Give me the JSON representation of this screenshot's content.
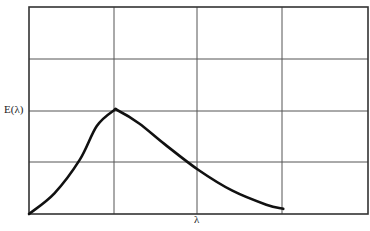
{
  "chart_data": {
    "type": "line",
    "title": "",
    "xlabel": "λ",
    "ylabel": "E(λ)",
    "grid": true,
    "legend": null,
    "xlim": [
      0,
      4
    ],
    "ylim": [
      0,
      4
    ],
    "x_ticks": [],
    "y_ticks": [],
    "series": [
      {
        "name": "E(λ)",
        "x": [
          0,
          0.3,
          0.6,
          0.8,
          1.0,
          1.05,
          1.3,
          1.6,
          2.0,
          2.4,
          2.8,
          3.0
        ],
        "y": [
          0,
          0.4,
          1.05,
          1.7,
          2.0,
          2.0,
          1.75,
          1.35,
          0.85,
          0.45,
          0.18,
          0.1
        ]
      }
    ],
    "annotations": []
  },
  "labels": {
    "y_axis": "E(λ)",
    "x_axis": "λ"
  },
  "colors": {
    "curve": "#111111",
    "grid": "#444444",
    "background": "#ffffff"
  }
}
